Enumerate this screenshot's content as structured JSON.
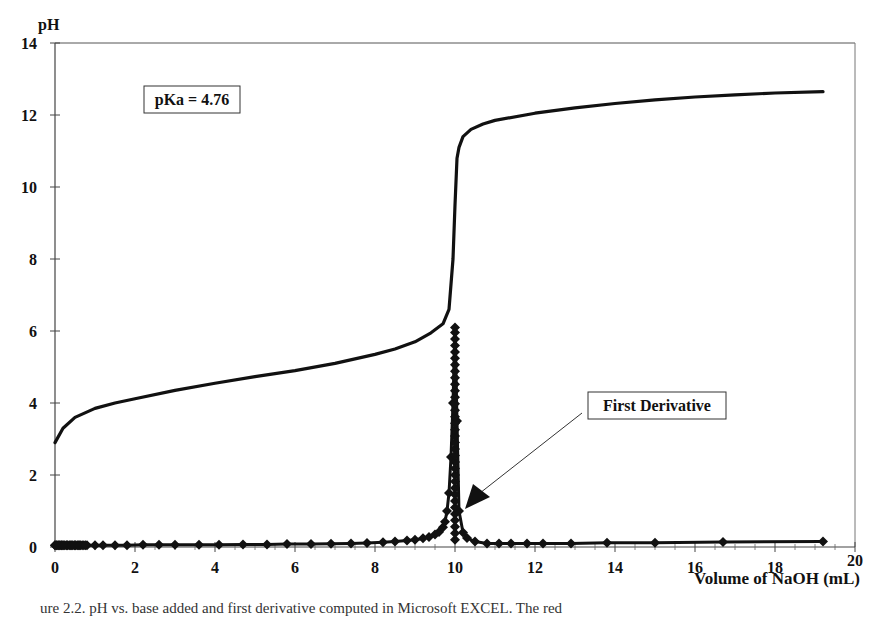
{
  "chart_data": {
    "type": "line",
    "title": "",
    "xlabel": "Volume of NaOH (mL)",
    "ylabel": "pH",
    "xlim": [
      0,
      20
    ],
    "ylim": [
      0,
      14
    ],
    "x_ticks": [
      0,
      2,
      4,
      6,
      8,
      10,
      12,
      14,
      16,
      18,
      20
    ],
    "y_ticks": [
      0,
      2,
      4,
      6,
      8,
      10,
      12,
      14
    ],
    "grid": false,
    "legend": "none",
    "series": [
      {
        "name": "pH",
        "style": "thick line",
        "x": [
          0,
          0.2,
          0.5,
          1,
          1.5,
          2,
          3,
          4,
          5,
          6,
          7,
          8,
          8.5,
          9,
          9.4,
          9.7,
          9.85,
          9.95,
          10.0,
          10.05,
          10.1,
          10.2,
          10.4,
          10.7,
          11,
          12,
          13,
          14,
          15,
          16,
          17,
          18,
          19.2
        ],
        "y": [
          2.9,
          3.3,
          3.6,
          3.85,
          4.0,
          4.12,
          4.35,
          4.55,
          4.73,
          4.9,
          5.1,
          5.35,
          5.5,
          5.7,
          5.95,
          6.2,
          6.6,
          8.0,
          9.5,
          10.8,
          11.1,
          11.4,
          11.6,
          11.75,
          11.85,
          12.05,
          12.2,
          12.32,
          12.42,
          12.5,
          12.56,
          12.61,
          12.65
        ]
      },
      {
        "name": "First Derivative",
        "style": "line with diamond markers",
        "x": [
          0,
          0.05,
          0.1,
          0.15,
          0.2,
          0.3,
          0.4,
          0.5,
          0.6,
          0.8,
          1.0,
          1.2,
          1.5,
          1.8,
          2.2,
          2.6,
          3.0,
          3.6,
          4.1,
          4.7,
          5.3,
          5.8,
          6.4,
          6.9,
          7.4,
          7.8,
          8.2,
          8.5,
          8.8,
          9.0,
          9.2,
          9.35,
          9.5,
          9.6,
          9.7,
          9.75,
          9.8,
          9.85,
          9.9,
          9.95,
          10.0,
          10.05,
          10.1,
          10.2,
          10.3,
          10.5,
          10.8,
          11.1,
          11.4,
          11.8,
          12.2,
          12.9,
          13.8,
          15.0,
          16.7,
          19.2
        ],
        "y": [
          0.05,
          0.05,
          0.05,
          0.05,
          0.05,
          0.05,
          0.05,
          0.05,
          0.05,
          0.05,
          0.05,
          0.05,
          0.05,
          0.05,
          0.06,
          0.06,
          0.06,
          0.06,
          0.06,
          0.07,
          0.07,
          0.08,
          0.08,
          0.09,
          0.1,
          0.11,
          0.13,
          0.15,
          0.18,
          0.2,
          0.24,
          0.28,
          0.35,
          0.42,
          0.55,
          0.7,
          1.0,
          1.5,
          2.5,
          4.0,
          6.1,
          3.5,
          1.0,
          0.4,
          0.25,
          0.15,
          0.1,
          0.1,
          0.1,
          0.1,
          0.1,
          0.1,
          0.12,
          0.12,
          0.14,
          0.15
        ]
      }
    ],
    "annotations": [
      {
        "text": "pKa = 4.76",
        "type": "boxed label",
        "position": "upper-left"
      },
      {
        "text": "First Derivative",
        "type": "boxed label with arrow",
        "arrow_points_to": {
          "x": 10.1,
          "y": 0.5
        }
      }
    ]
  },
  "labels": {
    "y_axis_title": "pH",
    "x_axis_title": "Volume of NaOH (mL)",
    "pka_box": "pKa = 4.76",
    "derivative_box": "First Derivative",
    "caption_fragment": "ure 2.2. pH vs. base added and first derivative computed in Microsoft EXCEL. The red"
  }
}
